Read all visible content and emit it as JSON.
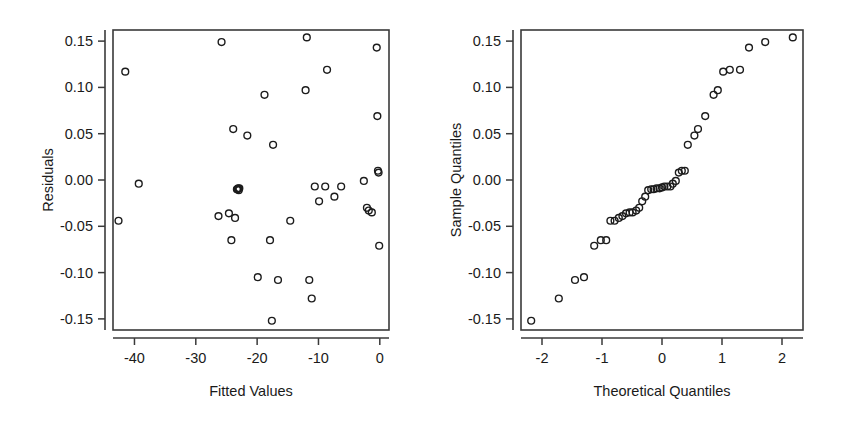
{
  "figure": {
    "background": "#ffffff",
    "point_color": "#1c1c1c",
    "axis_color": "#3a3a3a",
    "panels": [
      "residuals-vs-fitted",
      "normal-qq"
    ]
  },
  "chart_data": [
    {
      "type": "scatter",
      "name": "residuals-vs-fitted",
      "title": "",
      "xlabel": "Fitted Values",
      "ylabel": "Residuals",
      "xlim": [
        -43.5,
        1.5
      ],
      "ylim": [
        -0.162,
        0.162
      ],
      "xticks": [
        -40,
        -30,
        -20,
        -10,
        0
      ],
      "xticklabels": [
        "-40",
        "-30",
        "-20",
        "-10",
        "0"
      ],
      "yticks": [
        0.15,
        0.1,
        0.05,
        0.0,
        -0.05,
        -0.1,
        -0.15
      ],
      "yticklabels": [
        "0.15",
        "0.10",
        "0.05",
        "0.00",
        "-0.05",
        "-0.10",
        "-0.15"
      ],
      "grid": false,
      "legend": "none",
      "marker": "open-circle",
      "x": [
        -42.6,
        -41.5,
        -39.3,
        -26.3,
        -25.8,
        -24.6,
        -24.2,
        -23.9,
        -23.6,
        -23.3,
        -23.2,
        -23.1,
        -22.9,
        -23.0,
        -21.6,
        -19.9,
        -18.8,
        -17.9,
        -17.6,
        -17.4,
        -16.6,
        -14.6,
        -12.1,
        -11.9,
        -11.5,
        -11.1,
        -10.6,
        -9.9,
        -8.9,
        -8.6,
        -7.4,
        -6.3,
        -2.6,
        -2.1,
        -1.8,
        -1.3,
        -0.5,
        -0.4,
        -0.3,
        -0.2,
        -0.1
      ],
      "y": [
        -0.044,
        0.117,
        -0.004,
        -0.039,
        0.149,
        -0.036,
        -0.065,
        0.055,
        -0.041,
        -0.01,
        -0.01,
        -0.009,
        -0.009,
        -0.011,
        0.048,
        -0.105,
        0.092,
        -0.065,
        -0.152,
        0.038,
        -0.108,
        -0.044,
        0.097,
        0.154,
        -0.108,
        -0.128,
        -0.007,
        -0.023,
        -0.007,
        0.119,
        -0.018,
        -0.007,
        -0.001,
        -0.03,
        -0.033,
        -0.035,
        0.143,
        0.069,
        0.01,
        0.008,
        -0.071
      ]
    },
    {
      "type": "scatter",
      "name": "normal-qq",
      "title": "",
      "xlabel": "Theoretical Quantiles",
      "ylabel": "Sample Quantiles",
      "xlim": [
        -2.35,
        2.35
      ],
      "ylim": [
        -0.162,
        0.162
      ],
      "xticks": [
        -2,
        -1,
        0,
        1,
        2
      ],
      "xticklabels": [
        "-2",
        "-1",
        "0",
        "1",
        "2"
      ],
      "yticks": [
        0.15,
        0.1,
        0.05,
        0.0,
        -0.05,
        -0.1,
        -0.15
      ],
      "yticklabels": [
        "0.15",
        "0.10",
        "0.05",
        "0.00",
        "-0.05",
        "-0.10",
        "-0.15"
      ],
      "grid": false,
      "legend": "none",
      "marker": "open-circle",
      "x": [
        -2.18,
        -1.72,
        -1.45,
        -1.3,
        -1.13,
        -1.02,
        -0.93,
        -0.86,
        -0.79,
        -0.72,
        -0.66,
        -0.6,
        -0.54,
        -0.49,
        -0.43,
        -0.38,
        -0.33,
        -0.28,
        -0.23,
        -0.18,
        -0.14,
        -0.09,
        -0.04,
        0.0,
        0.04,
        0.09,
        0.14,
        0.18,
        0.23,
        0.28,
        0.33,
        0.38,
        0.43,
        0.54,
        0.6,
        0.72,
        0.86,
        0.93,
        1.02,
        1.13,
        1.3,
        1.45,
        1.72,
        2.18
      ],
      "y": [
        -0.152,
        -0.128,
        -0.108,
        -0.105,
        -0.071,
        -0.065,
        -0.065,
        -0.044,
        -0.044,
        -0.041,
        -0.039,
        -0.036,
        -0.035,
        -0.035,
        -0.033,
        -0.03,
        -0.023,
        -0.018,
        -0.011,
        -0.01,
        -0.01,
        -0.009,
        -0.009,
        -0.008,
        -0.007,
        -0.007,
        -0.007,
        -0.004,
        -0.001,
        0.008,
        0.01,
        0.01,
        0.038,
        0.048,
        0.055,
        0.069,
        0.092,
        0.097,
        0.117,
        0.119,
        0.119,
        0.143,
        0.149,
        0.154
      ]
    }
  ]
}
